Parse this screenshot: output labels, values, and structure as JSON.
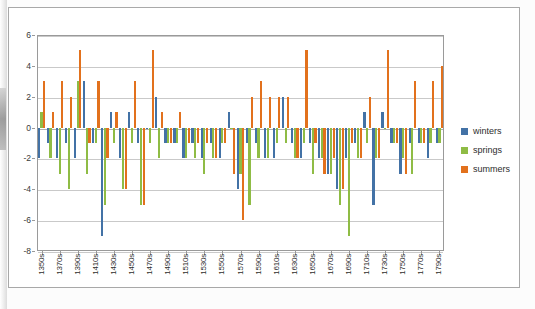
{
  "chart_data": {
    "type": "bar",
    "title": "",
    "xlabel": "",
    "ylabel": "",
    "ylim": [
      -8,
      6
    ],
    "ytick_step": 2,
    "yticks": [
      6,
      4,
      2,
      0,
      -2,
      -4,
      -6,
      -8
    ],
    "grid": true,
    "legend_position": "right",
    "categories": [
      "1350s",
      "1360s",
      "1370s",
      "1380s",
      "1390s",
      "1400s",
      "1410s",
      "1420s",
      "1430s",
      "1440s",
      "1450s",
      "1460s",
      "1470s",
      "1480s",
      "1490s",
      "1500s",
      "1510s",
      "1520s",
      "1530s",
      "1540s",
      "1550s",
      "1560s",
      "1570s",
      "1580s",
      "1590s",
      "1600s",
      "1610s",
      "1620s",
      "1630s",
      "1640s",
      "1650s",
      "1660s",
      "1670s",
      "1680s",
      "1690s",
      "1700s",
      "1710s",
      "1720s",
      "1730s",
      "1740s",
      "1750s",
      "1760s",
      "1770s",
      "1780s",
      "1790s"
    ],
    "xtick_labels": [
      "1350s",
      "1370s",
      "1390s",
      "1410s",
      "1430s",
      "1450s",
      "1470s",
      "1490s",
      "1510s",
      "1530s",
      "1550s",
      "1570s",
      "1590s",
      "1610s",
      "1630s",
      "1650s",
      "1670s",
      "1690s",
      "1710s",
      "1730s",
      "1750s",
      "1770s",
      "1790s"
    ],
    "series": [
      {
        "name": "winters",
        "color": "#4372A6",
        "values": [
          -2,
          -1,
          -2,
          -1,
          -2,
          3,
          -1,
          -7,
          1,
          -2,
          1,
          -1,
          0,
          2,
          -1,
          -1,
          -2,
          -1,
          -2,
          -1,
          -2,
          1,
          -4,
          -1,
          -1,
          -2,
          -2,
          2,
          -1,
          -2,
          -1,
          -2,
          -3,
          -4,
          -2,
          -1,
          1,
          -5,
          1,
          -1,
          -3,
          -1,
          -1,
          -2,
          -1
        ]
      },
      {
        "name": "springs",
        "color": "#8FBC45",
        "values": [
          1,
          -2,
          -3,
          -4,
          3,
          -3,
          -1,
          -5,
          -1,
          -4,
          -1,
          -5,
          -1,
          -2,
          -1,
          -1,
          -2,
          -2,
          -3,
          -2,
          -1,
          0,
          -3,
          -5,
          -2,
          -2,
          -1,
          -1,
          -2,
          -1,
          -3,
          -2,
          -3,
          -5,
          -7,
          -2,
          -1,
          -2,
          0,
          -1,
          -2,
          -3,
          -1,
          -1,
          -1
        ]
      },
      {
        "name": "summers",
        "color": "#E2711D",
        "values": [
          3,
          1,
          3,
          2,
          5,
          -1,
          3,
          -2,
          1,
          -4,
          3,
          -5,
          5,
          1,
          -1,
          1,
          -1,
          -1,
          -1,
          -2,
          -1,
          -3,
          -6,
          2,
          3,
          2,
          2,
          2,
          -2,
          5,
          -1,
          -3,
          -2,
          -4,
          -1,
          -2,
          2,
          -2,
          5,
          -1,
          -3,
          3,
          -1,
          3,
          4
        ]
      }
    ]
  },
  "legend": {
    "items": [
      {
        "label": "winters",
        "color": "#4372A6"
      },
      {
        "label": "springs",
        "color": "#8FBC45"
      },
      {
        "label": "summers",
        "color": "#E2711D"
      }
    ]
  },
  "caption": {
    "text": ""
  }
}
